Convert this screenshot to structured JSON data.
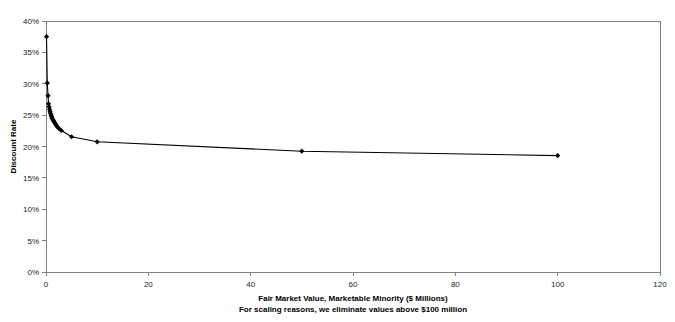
{
  "chart_data": {
    "type": "line",
    "title": "",
    "xlabel": "Fair Market Value, Marketable Minority ($ Millions)",
    "ylabel": "Discount Rate",
    "note": "For scaling reasons, we eliminate values above $100 million",
    "xlim": [
      0,
      120
    ],
    "ylim": [
      0,
      0.4
    ],
    "x_ticks": [
      0,
      20,
      40,
      60,
      80,
      100,
      120
    ],
    "x_tick_labels": [
      "0",
      "20",
      "40",
      "60",
      "80",
      "100",
      "120"
    ],
    "y_ticks": [
      0,
      0.05,
      0.1,
      0.15,
      0.2,
      0.25,
      0.3,
      0.35,
      0.4
    ],
    "y_tick_labels": [
      "0%",
      "5%",
      "10%",
      "15%",
      "20%",
      "25%",
      "30%",
      "35%",
      "40%"
    ],
    "grid": false,
    "legend": "none",
    "marker": "diamond",
    "series": [
      {
        "name": "Discount Rate vs Fair Market Value",
        "x": [
          0.1,
          0.25,
          0.4,
          0.5,
          0.6,
          0.7,
          0.8,
          0.9,
          1.0,
          1.1,
          1.2,
          1.35,
          1.5,
          1.65,
          1.8,
          2.0,
          2.2,
          2.5,
          3.0,
          5.0,
          10.0,
          50.0,
          100.0
        ],
        "y": [
          0.375,
          0.301,
          0.281,
          0.268,
          0.263,
          0.259,
          0.2555,
          0.2525,
          0.25,
          0.2475,
          0.245,
          0.2425,
          0.2405,
          0.2385,
          0.2365,
          0.234,
          0.2315,
          0.229,
          0.2255,
          0.2155,
          0.2075,
          0.1925,
          0.1855
        ]
      }
    ]
  },
  "axis_titles": {
    "x_line1": "Fair Market Value, Marketable Minority ($ Millions)",
    "x_line2": "For scaling reasons, we eliminate values above $100 million",
    "y": "Discount Rate"
  },
  "colors": {
    "series": "#000000",
    "frame": "#808080",
    "text": "#000000",
    "background": "#ffffff"
  },
  "geometry": {
    "plot_left": 46,
    "plot_right": 660,
    "plot_top": 21,
    "plot_bottom": 272
  }
}
